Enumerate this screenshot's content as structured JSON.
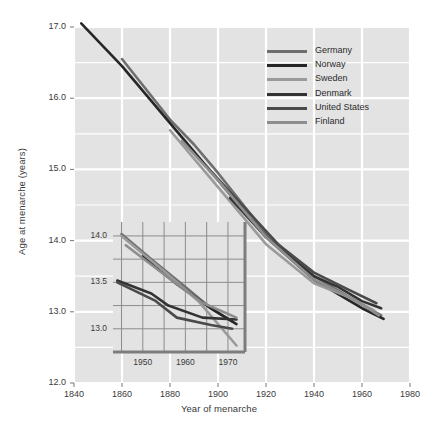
{
  "chart_data": {
    "type": "line",
    "title": "",
    "xlabel": "Year of menarche",
    "ylabel": "Age at menarche (years)",
    "xlim": [
      1840,
      1980
    ],
    "ylim": [
      12.0,
      17.0
    ],
    "xticks": [
      "1840",
      "1860",
      "1880",
      "1900",
      "1920",
      "1940",
      "1960",
      "1980"
    ],
    "yticks": [
      "12.0",
      "13.0",
      "14.0",
      "15.0",
      "16.0",
      "17.0"
    ],
    "grid": true,
    "legend_position": "top-right",
    "series": [
      {
        "name": "Germany",
        "color": "#6e6e6e",
        "points": [
          [
            1860,
            16.55
          ],
          [
            1880,
            15.7
          ],
          [
            1890,
            15.35
          ],
          [
            1900,
            14.95
          ],
          [
            1920,
            14.1
          ],
          [
            1940,
            13.5
          ],
          [
            1960,
            13.1
          ],
          [
            1968,
            12.95
          ]
        ]
      },
      {
        "name": "Norway",
        "color": "#262626",
        "points": [
          [
            1843,
            17.05
          ],
          [
            1860,
            16.45
          ],
          [
            1880,
            15.65
          ],
          [
            1900,
            14.85
          ],
          [
            1920,
            14.05
          ],
          [
            1940,
            13.45
          ],
          [
            1960,
            13.05
          ],
          [
            1969,
            12.9
          ]
        ]
      },
      {
        "name": "Sweden",
        "color": "#9a9a9a",
        "points": [
          [
            1880,
            15.55
          ],
          [
            1900,
            14.75
          ],
          [
            1920,
            13.95
          ],
          [
            1940,
            13.4
          ],
          [
            1955,
            13.2
          ],
          [
            1965,
            13.02
          ]
        ]
      },
      {
        "name": "Denmark",
        "color": "#333333",
        "points": [
          [
            1905,
            14.6
          ],
          [
            1920,
            14.05
          ],
          [
            1940,
            13.5
          ],
          [
            1950,
            13.35
          ],
          [
            1960,
            13.15
          ],
          [
            1968,
            13.05
          ]
        ]
      },
      {
        "name": "United States",
        "color": "#4a4a4a",
        "points": [
          [
            1895,
            15.05
          ],
          [
            1910,
            14.5
          ],
          [
            1925,
            13.95
          ],
          [
            1940,
            13.55
          ],
          [
            1955,
            13.3
          ],
          [
            1966,
            13.12
          ]
        ]
      },
      {
        "name": "Finland",
        "color": "#8d8d8d",
        "points": [
          [
            1885,
            15.4
          ],
          [
            1900,
            14.85
          ],
          [
            1920,
            14.05
          ],
          [
            1940,
            13.45
          ],
          [
            1958,
            13.15
          ],
          [
            1967,
            12.95
          ]
        ]
      }
    ]
  },
  "inset": {
    "type": "line",
    "xlim": [
      1943,
      1974
    ],
    "ylim": [
      12.75,
      14.15
    ],
    "xticks": [
      "1950",
      "1960",
      "1970"
    ],
    "yticks": [
      "13.0",
      "13.5",
      "14.0"
    ],
    "grid": true,
    "series": [
      {
        "name": "Germany",
        "color": "#6e6e6e",
        "points": [
          [
            1945,
            14.02
          ],
          [
            1952,
            13.75
          ],
          [
            1960,
            13.45
          ],
          [
            1966,
            13.22
          ],
          [
            1971,
            13.08
          ]
        ]
      },
      {
        "name": "Norway",
        "color": "#262626",
        "points": [
          [
            1950,
            13.78
          ],
          [
            1958,
            13.48
          ],
          [
            1966,
            13.22
          ],
          [
            1972,
            13.05
          ]
        ]
      },
      {
        "name": "Sweden",
        "color": "#9a9a9a",
        "points": [
          [
            1945,
            14.0
          ],
          [
            1955,
            13.62
          ],
          [
            1963,
            13.3
          ],
          [
            1972,
            12.82
          ]
        ]
      },
      {
        "name": "Denmark",
        "color": "#333333",
        "points": [
          [
            1944,
            13.52
          ],
          [
            1952,
            13.38
          ],
          [
            1956,
            13.25
          ],
          [
            1964,
            13.12
          ],
          [
            1972,
            13.1
          ]
        ]
      },
      {
        "name": "United States",
        "color": "#4a4a4a",
        "points": [
          [
            1944,
            13.5
          ],
          [
            1953,
            13.3
          ],
          [
            1958,
            13.12
          ],
          [
            1966,
            13.04
          ],
          [
            1971,
            13.0
          ]
        ]
      },
      {
        "name": "Finland",
        "color": "#8d8d8d",
        "points": [
          [
            1946,
            13.9
          ],
          [
            1956,
            13.55
          ],
          [
            1964,
            13.28
          ],
          [
            1972,
            13.12
          ]
        ]
      }
    ]
  },
  "colors": {
    "plot_background": "#e3e3e3",
    "gridline": "#ffffff",
    "inset_gridline": "#8c8c8c",
    "inset_axis": "#7d7d7d",
    "text": "#2b2b2b"
  }
}
